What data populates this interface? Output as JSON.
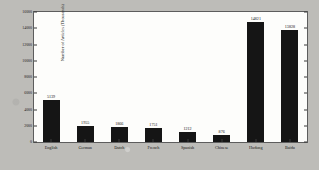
{
  "chart_data": {
    "type": "bar",
    "title": "",
    "xlabel": "",
    "ylabel": "Number of Articles (Thousands)",
    "categories": [
      "English",
      "German",
      "Dutch",
      "French",
      "Spanish",
      "Chinese",
      "Hudong",
      "Baidu"
    ],
    "values": [
      5139,
      1955,
      1866,
      1751,
      1212,
      876,
      14821,
      13828
    ],
    "value_labels": [
      "5139",
      "1955",
      "1866",
      "1751",
      "1212",
      "876",
      "14821",
      "13828"
    ],
    "ylim": [
      0,
      16000
    ],
    "yticks": [
      0,
      2000,
      4000,
      6000,
      8000,
      10000,
      12000,
      14000,
      16000
    ],
    "ytick_labels": [
      "0",
      "2000",
      "4000",
      "6000",
      "8000",
      "10000",
      "12000",
      "14000",
      "16000"
    ],
    "grid": false,
    "legend": null,
    "bar_color": "#151515",
    "plot_background": "#fdfdfb",
    "figure_background": "#bdbcb8",
    "axis_color": "#5d5d5d"
  }
}
